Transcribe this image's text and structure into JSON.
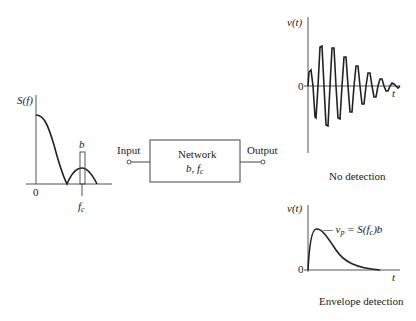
{
  "spectrum_plot": {
    "y_label": "S(f)",
    "origin_label": "0",
    "bandwidth_label": "b",
    "center_freq_label": "f",
    "center_freq_sub": "c"
  },
  "network": {
    "title": "Network",
    "params": "b, f",
    "params_sub": "c",
    "input_label": "Input",
    "output_label": "Output"
  },
  "no_detection_plot": {
    "y_label": "v(t)",
    "origin_label": "0",
    "x_label": "t",
    "caption": "No detection"
  },
  "envelope_plot": {
    "y_label": "v(t)",
    "origin_label": "0",
    "x_label": "t",
    "peak_annotation_prefix": "— v",
    "peak_annotation_sub": "p",
    "peak_annotation_mid": " = S(f",
    "peak_annotation_sub2": "c",
    "peak_annotation_suffix": ")b",
    "caption": "Envelope detection"
  },
  "colors": {
    "line": "#222222",
    "axis": "#555555",
    "background": "#ffffff"
  }
}
